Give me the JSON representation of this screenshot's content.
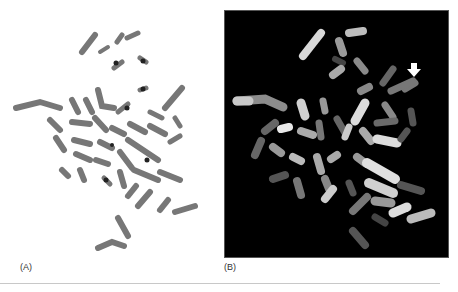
{
  "figure": {
    "panels": [
      {
        "id": "A",
        "label": "(A)",
        "description": "G-banded metaphase chromosome spread, grayscale on white"
      },
      {
        "id": "B",
        "label": "(B)",
        "description": "Fluorescent painted metaphase chromosome spread on black background",
        "annotation": "white arrow pointing to chromosome at upper right"
      }
    ],
    "colors": {
      "panelA_bg": "#ffffff",
      "panelB_bg": "#000000",
      "chromosome_dark": "#6a6a6a",
      "arrow": "#ffffff"
    }
  }
}
